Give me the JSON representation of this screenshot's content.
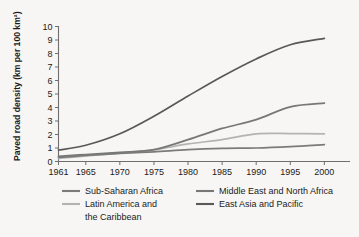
{
  "chart_data": {
    "type": "line",
    "title": "",
    "xlabel": "",
    "ylabel": "Paved road density (km per 100 km²)",
    "xlim": [
      1961,
      2002
    ],
    "ylim": [
      0,
      10
    ],
    "grid": false,
    "legend_position": "bottom",
    "x_ticks": [
      "1961",
      "1965",
      "1970",
      "1975",
      "1980",
      "1985",
      "1990",
      "1995",
      "2000"
    ],
    "x_tick_values": [
      1961,
      1965,
      1970,
      1975,
      1980,
      1985,
      1990,
      1995,
      2000
    ],
    "y_ticks": [
      "0",
      "1",
      "2",
      "3",
      "4",
      "5",
      "6",
      "7",
      "8",
      "9",
      "10"
    ],
    "y_tick_values": [
      0,
      1,
      2,
      3,
      4,
      5,
      6,
      7,
      8,
      9,
      10
    ],
    "x": [
      1961,
      1965,
      1970,
      1975,
      1980,
      1985,
      1990,
      1995,
      2000
    ],
    "series": [
      {
        "name": "Sub-Saharan Africa",
        "color": "#7b7b7b",
        "values": [
          0.3,
          0.45,
          0.6,
          0.72,
          0.88,
          0.97,
          1.0,
          1.1,
          1.25
        ]
      },
      {
        "name": "Middle East and North Africa",
        "color": "#777777",
        "values": [
          0.38,
          0.52,
          0.68,
          0.88,
          1.62,
          2.45,
          3.1,
          4.05,
          4.32
        ]
      },
      {
        "name": "Latin America and the Caribbean",
        "color": "#b3b3b3",
        "values": [
          0.22,
          0.42,
          0.62,
          0.86,
          1.3,
          1.62,
          2.05,
          2.07,
          2.05
        ]
      },
      {
        "name": "East Asia and Pacific",
        "color": "#595959",
        "values": [
          0.85,
          1.2,
          2.05,
          3.35,
          4.85,
          6.3,
          7.6,
          8.65,
          9.12
        ]
      }
    ]
  },
  "legend": {
    "entries": [
      {
        "label": "Sub-Saharan Africa",
        "color": "#7b7b7b"
      },
      {
        "label": "Middle East and North Africa",
        "color": "#777777"
      },
      {
        "label": "Latin America and",
        "color": "#b3b3b3"
      },
      {
        "label": "the Caribbean",
        "color": "#b3b3b3"
      },
      {
        "label": "East Asia and Pacific",
        "color": "#595959"
      }
    ]
  },
  "colors": {
    "background": "#f7f6f4",
    "axis": "#6f6f6f",
    "text": "#1b1b1b"
  }
}
